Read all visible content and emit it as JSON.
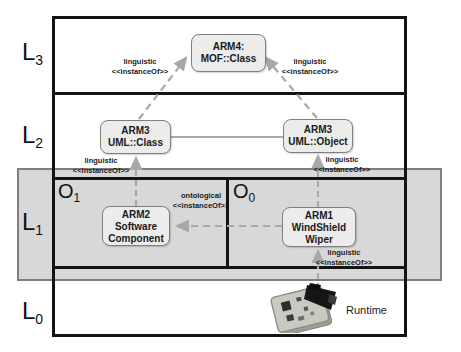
{
  "diagram_type": "multi-level modeling hierarchy",
  "colors": {
    "frame": "#141414",
    "band_fill": "#d6d6d6",
    "band_border": "#7f7f7f",
    "node_fill": "#ececec",
    "node_border": "#7f7f7f",
    "connector": "#a8a8a8"
  },
  "levels": [
    {
      "base": "L",
      "sub": "3"
    },
    {
      "base": "L",
      "sub": "2"
    },
    {
      "base": "L",
      "sub": "1"
    },
    {
      "base": "L",
      "sub": "0"
    }
  ],
  "regions": [
    {
      "base": "O",
      "sub": "1"
    },
    {
      "base": "O",
      "sub": "0"
    }
  ],
  "nodes": {
    "arm4": {
      "lines": [
        "ARM4:",
        "MOF::Class"
      ]
    },
    "arm3_class": {
      "lines": [
        "ARM3",
        "UML::Class"
      ]
    },
    "arm3_object": {
      "lines": [
        "ARM3",
        "UML::Object"
      ]
    },
    "arm2": {
      "lines": [
        "ARM2",
        "Software",
        "Component"
      ]
    },
    "arm1": {
      "lines": [
        "ARM1",
        "WindShield",
        "Wiper"
      ]
    }
  },
  "edge_labels": {
    "l3_left": {
      "lines": [
        "linguistic",
        "<<instanceOf>>"
      ]
    },
    "l3_right": {
      "lines": [
        "linguistic",
        "<<instanceOf>>"
      ]
    },
    "l2_left": {
      "lines": [
        "linguistic",
        "<<instanceOf>>"
      ]
    },
    "l2_right": {
      "lines": [
        "linguistic",
        "<<instanceOf>>"
      ]
    },
    "ontological": {
      "lines": [
        "ontological",
        "<<instanceOf>>"
      ]
    },
    "l1_runtime": {
      "lines": [
        "linguistic",
        "<<instanceOf>>"
      ]
    }
  },
  "runtime": {
    "label": "Runtime"
  }
}
